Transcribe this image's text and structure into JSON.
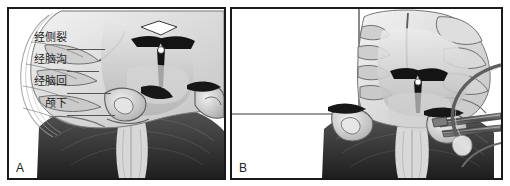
{
  "figure": {
    "kind": "anatomical-illustration",
    "background_color": "#ffffff",
    "border_color": "#1a1a1a"
  },
  "panels": [
    {
      "id": "A",
      "letter": "A",
      "annotations": [
        {
          "label": "经侧裂",
          "meaning": "trans-sylvian-fissure",
          "leader": true
        },
        {
          "label": "经脑沟",
          "meaning": "trans-sulcal",
          "leader": true
        },
        {
          "label": "经脑回",
          "meaning": "trans-gyral",
          "leader": true
        },
        {
          "label": "颅下",
          "meaning": "subtemporal",
          "leader": true
        }
      ],
      "artwork": {
        "view": "coronal-section",
        "structures": [
          "temporal-lobe",
          "sylvian-fissure",
          "hippocampus",
          "lateral-ventricle",
          "brainstem",
          "cerebellum"
        ],
        "tones": {
          "cortex_light": "#e9e9e9",
          "cortex_mid": "#c8c8c8",
          "white_matter": "#dedede",
          "deep_shadow": "#2b2b2b",
          "cerebellum_dark": "#3c3c3c",
          "outline": "#555555"
        }
      }
    },
    {
      "id": "B",
      "letter": "B",
      "annotations": [],
      "inset": {
        "present": true,
        "position": "upper-left",
        "view": "magnified-oblique",
        "border_color": "#3a3a3a"
      },
      "artwork": {
        "view": "coronal-section-with-instruments",
        "structures": [
          "temporal-lobe",
          "hippocampus",
          "lateral-ventricle",
          "brainstem",
          "cerebellum",
          "retractor",
          "suction-tube",
          "bipolar-forceps"
        ],
        "tones": {
          "cortex_light": "#ececec",
          "cortex_mid": "#cacaca",
          "white_matter": "#e0e0e0",
          "deep_shadow": "#2b2b2b",
          "cerebellum_dark": "#3c3c3c",
          "instrument": "#6e6e6e",
          "outline": "#555555"
        }
      }
    }
  ]
}
